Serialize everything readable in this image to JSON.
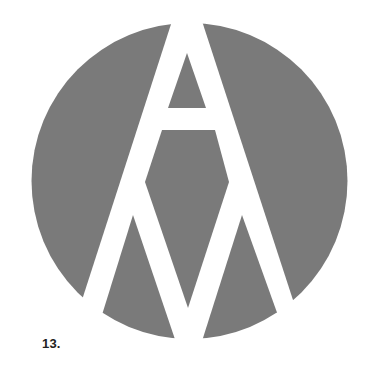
{
  "figure": {
    "caption": "13.",
    "logo_name": "circle-A-M-monogram",
    "colors": {
      "fill": "#7a7a7a",
      "background": "#ffffff",
      "caption": "#222222"
    }
  }
}
